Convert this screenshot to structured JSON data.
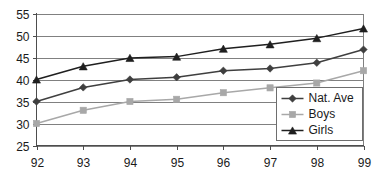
{
  "chart_data": {
    "type": "line",
    "title": "",
    "subtitle": "",
    "xlabel": "",
    "ylabel": "",
    "categories": [
      "92",
      "93",
      "94",
      "95",
      "96",
      "97",
      "98",
      "99"
    ],
    "x": [
      92,
      93,
      94,
      95,
      96,
      97,
      98,
      99
    ],
    "ylim": [
      25,
      55
    ],
    "yticks": [
      25,
      30,
      35,
      40,
      45,
      50,
      55
    ],
    "ytick_labels": [
      "25",
      "30",
      "35",
      "40",
      "45",
      "50",
      "55"
    ],
    "xtick_labels": [
      "92",
      "93",
      "94",
      "95",
      "96",
      "97",
      "98",
      "99"
    ],
    "grid": "horizontal",
    "legend_position": "bottom-right",
    "series": [
      {
        "name": "Nat. Ave",
        "marker": "diamond",
        "color": "#3f3f3f",
        "values": [
          35.0,
          38.2,
          40.0,
          40.5,
          42.0,
          42.5,
          43.8,
          46.8
        ]
      },
      {
        "name": "Boys",
        "marker": "square",
        "color": "#a8a8a8",
        "values": [
          30.0,
          33.0,
          35.0,
          35.5,
          37.0,
          38.1,
          39.2,
          42.0
        ]
      },
      {
        "name": "Girls",
        "marker": "triangle",
        "color": "#1f1f1f",
        "values": [
          40.0,
          43.0,
          44.9,
          45.2,
          47.0,
          48.0,
          49.4,
          51.6
        ]
      }
    ]
  },
  "legend": {
    "entries": [
      {
        "label": "Nat. Ave"
      },
      {
        "label": "Boys"
      },
      {
        "label": "Girls"
      }
    ]
  },
  "colors": {
    "axis": "#4d4d4d",
    "grid": "#808080",
    "background": "#ffffff",
    "text": "#1a1a1a"
  }
}
